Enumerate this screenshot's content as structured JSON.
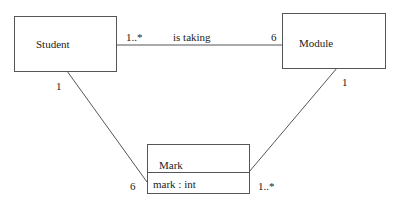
{
  "diagram": {
    "type": "UML class diagram",
    "classes": [
      {
        "id": "student",
        "name": "Student",
        "attributes": []
      },
      {
        "id": "module",
        "name": "Module",
        "attributes": []
      },
      {
        "id": "mark",
        "name": "Mark",
        "attributes": [
          "mark : int"
        ]
      }
    ],
    "associations": [
      {
        "id": "student-module",
        "from": "Student",
        "to": "Module",
        "label": "is taking",
        "from_multiplicity": "1..*",
        "to_multiplicity": "6"
      },
      {
        "id": "student-mark",
        "from": "Student",
        "to": "Mark",
        "from_multiplicity": "1",
        "to_multiplicity": "6"
      },
      {
        "id": "module-mark",
        "from": "Module",
        "to": "Mark",
        "from_multiplicity": "1",
        "to_multiplicity": "1..*"
      }
    ],
    "colors": {
      "line": "#555555",
      "text": "#222222",
      "background": "#ffffff"
    }
  }
}
